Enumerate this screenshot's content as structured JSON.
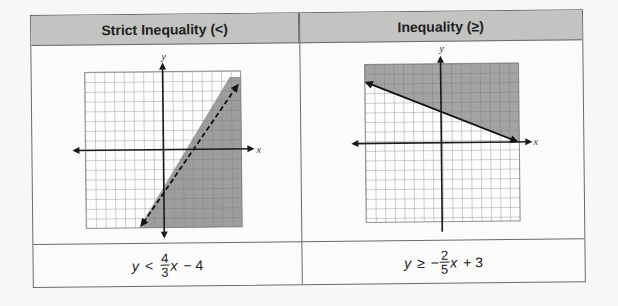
{
  "table": {
    "columns": [
      {
        "header": "Strict Inequality (<)",
        "graph": {
          "x_label": "x",
          "y_label": "y",
          "grid": {
            "xmin": -8,
            "xmax": 8,
            "ymin": -8,
            "ymax": 8
          },
          "boundary": {
            "slope": "4/3",
            "intercept": -4,
            "style": "dashed"
          },
          "shaded_region": "below line"
        },
        "formula": {
          "lhs": "y",
          "op": "<",
          "frac_num": "4",
          "frac_den": "3",
          "var": "x",
          "rest": "− 4"
        }
      },
      {
        "header": "Inequality (≥)",
        "graph": {
          "x_label": "x",
          "y_label": "y",
          "grid": {
            "xmin": -8,
            "xmax": 8,
            "ymin": -8,
            "ymax": 8
          },
          "boundary": {
            "slope": "-2/5",
            "intercept": 3,
            "style": "solid"
          },
          "shaded_region": "above line"
        },
        "formula": {
          "lhs": "y",
          "op": "≥",
          "sign": "−",
          "frac_num": "2",
          "frac_den": "5",
          "var": "x",
          "rest": "+ 3"
        }
      }
    ]
  }
}
